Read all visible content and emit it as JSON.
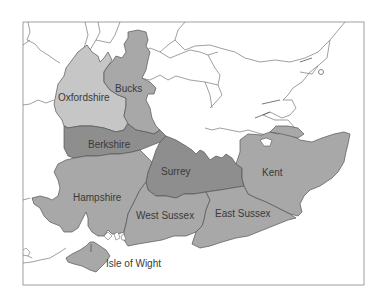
{
  "map": {
    "type": "choropleth",
    "region": "South East England",
    "colors": {
      "background": "#ffffff",
      "frame": "#888888",
      "border": "#555555",
      "light": "#c6c6c6",
      "medium": "#a8a8a8",
      "dark": "#8e8e8e"
    },
    "counties": [
      {
        "name": "Oxfordshire",
        "label": "Oxfordshire",
        "shade": "light"
      },
      {
        "name": "Bucks",
        "label": "Bucks",
        "shade": "medium"
      },
      {
        "name": "Berkshire",
        "label": "Berkshire",
        "shade": "dark"
      },
      {
        "name": "Surrey",
        "label": "Surrey",
        "shade": "dark"
      },
      {
        "name": "Kent",
        "label": "Kent",
        "shade": "medium"
      },
      {
        "name": "Hampshire",
        "label": "Hampshire",
        "shade": "medium"
      },
      {
        "name": "West Sussex",
        "label": "West Sussex",
        "shade": "medium"
      },
      {
        "name": "East Sussex",
        "label": "East Sussex",
        "shade": "medium"
      },
      {
        "name": "Isle of Wight",
        "label": "Isle of Wight",
        "shade": "medium"
      }
    ]
  },
  "labels": {
    "oxfordshire": "Oxfordshire",
    "bucks": "Bucks",
    "berkshire": "Berkshire",
    "surrey": "Surrey",
    "kent": "Kent",
    "hampshire": "Hampshire",
    "west_sussex": "West Sussex",
    "east_sussex": "East Sussex",
    "isle_of_wight": "Isle of Wight"
  }
}
